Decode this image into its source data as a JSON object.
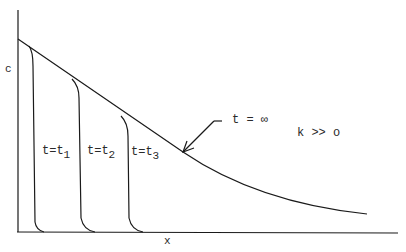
{
  "diagram": {
    "type": "concentration profiles",
    "axes": {
      "y_label": "c",
      "x_label": "x"
    },
    "curves": [
      {
        "id": "t1",
        "label_prefix": "t=t",
        "label_sub": "1"
      },
      {
        "id": "t2",
        "label_prefix": "t=t",
        "label_sub": "2"
      },
      {
        "id": "t3",
        "label_prefix": "t=t",
        "label_sub": "3"
      },
      {
        "id": "tinf",
        "label": "t = ∞"
      }
    ],
    "annotation": "k >> o",
    "colors": {
      "line": "#1a1a1a",
      "text": "#2a2a2a",
      "background": "#ffffff"
    }
  }
}
